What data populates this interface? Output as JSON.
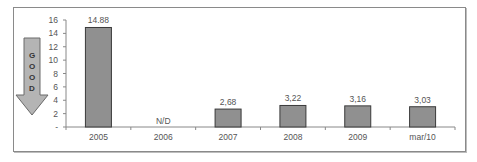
{
  "chart_data": {
    "type": "bar",
    "title": "",
    "xlabel": "",
    "ylabel": "",
    "categories": [
      "2005",
      "2006",
      "2007",
      "2008",
      "2009",
      "mar/10"
    ],
    "values": [
      14.88,
      null,
      2.68,
      3.22,
      3.16,
      3.03
    ],
    "data_labels": [
      "14.88",
      "N/D",
      "2,68",
      "3,22",
      "3,16",
      "3,03"
    ],
    "ylim": [
      0,
      16
    ],
    "yticks": [
      "-",
      "2",
      "4",
      "6",
      "8",
      "10",
      "12",
      "14",
      "16"
    ],
    "grid": false,
    "legend": null,
    "bar_color": "#909090",
    "annotation": {
      "type": "down-arrow",
      "text": "GOOD",
      "letters": [
        "G",
        "O",
        "O",
        "D"
      ],
      "meaning": "lower is better"
    }
  }
}
